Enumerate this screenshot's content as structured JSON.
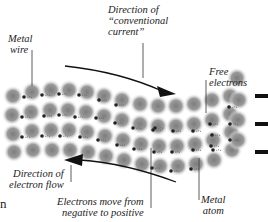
{
  "labels": {
    "metal_wire": [
      "Metal",
      "wire"
    ],
    "conventional_current": [
      "Direction of",
      "“conventional",
      "current”"
    ],
    "free_electrons": [
      "Free",
      "electrons"
    ],
    "electron_flow": [
      "Direction of",
      "electron flow"
    ],
    "electrons_move": [
      "Electrons move from",
      "negative to positive"
    ],
    "metal_atom": [
      "Metal",
      "atom"
    ]
  },
  "edge_fragment": "n",
  "colors": {
    "atom": "#8a8a8a",
    "electron": "#222222",
    "arrow": "#111111",
    "text": "#222222"
  },
  "atoms": [
    [
      13,
      96
    ],
    [
      32,
      92
    ],
    [
      51,
      90
    ],
    [
      69,
      90
    ],
    [
      87,
      92
    ],
    [
      104,
      96
    ],
    [
      122,
      100
    ],
    [
      140,
      104
    ],
    [
      158,
      106
    ],
    [
      176,
      106
    ],
    [
      194,
      104
    ],
    [
      212,
      100
    ],
    [
      230,
      96
    ],
    [
      237,
      78
    ],
    [
      12,
      115
    ],
    [
      31,
      112
    ],
    [
      50,
      110
    ],
    [
      68,
      110
    ],
    [
      86,
      112
    ],
    [
      104,
      116
    ],
    [
      122,
      120
    ],
    [
      140,
      124
    ],
    [
      158,
      126
    ],
    [
      176,
      126
    ],
    [
      194,
      124
    ],
    [
      212,
      120
    ],
    [
      230,
      114
    ],
    [
      239,
      100
    ],
    [
      13,
      134
    ],
    [
      32,
      131
    ],
    [
      51,
      130
    ],
    [
      69,
      130
    ],
    [
      87,
      132
    ],
    [
      105,
      136
    ],
    [
      123,
      140
    ],
    [
      141,
      144
    ],
    [
      159,
      146
    ],
    [
      177,
      146
    ],
    [
      195,
      144
    ],
    [
      213,
      140
    ],
    [
      231,
      132
    ],
    [
      238,
      120
    ],
    [
      14,
      152
    ],
    [
      33,
      150
    ],
    [
      52,
      150
    ],
    [
      70,
      150
    ],
    [
      88,
      152
    ],
    [
      106,
      156
    ],
    [
      124,
      160
    ],
    [
      142,
      164
    ],
    [
      160,
      166
    ],
    [
      178,
      166
    ],
    [
      196,
      164
    ],
    [
      214,
      160
    ],
    [
      232,
      150
    ],
    [
      238,
      140
    ]
  ],
  "electrons": [
    [
      24,
      97
    ],
    [
      42,
      95
    ],
    [
      59,
      94
    ],
    [
      79,
      95
    ],
    [
      99,
      100
    ],
    [
      116,
      105
    ],
    [
      22,
      117
    ],
    [
      44,
      116
    ],
    [
      59,
      115
    ],
    [
      75,
      117
    ],
    [
      96,
      118
    ],
    [
      115,
      123
    ],
    [
      133,
      128
    ],
    [
      153,
      130
    ],
    [
      173,
      131
    ],
    [
      193,
      131
    ],
    [
      210,
      124
    ],
    [
      229,
      107
    ],
    [
      22,
      137
    ],
    [
      42,
      136
    ],
    [
      60,
      136
    ],
    [
      80,
      137
    ],
    [
      98,
      140
    ],
    [
      117,
      145
    ],
    [
      134,
      149
    ],
    [
      154,
      152
    ],
    [
      172,
      152
    ],
    [
      193,
      150
    ],
    [
      211,
      146
    ],
    [
      230,
      124
    ],
    [
      155,
      128
    ],
    [
      212,
      135
    ],
    [
      230,
      140
    ],
    [
      152,
      168
    ],
    [
      171,
      171
    ],
    [
      191,
      169
    ],
    [
      213,
      150
    ]
  ],
  "arrows": {
    "conventional": {
      "path": "M65,66 Q110,74 170,93",
      "head": [
        170,
        93
      ]
    },
    "electron_flow": {
      "path": "M180,183 Q120,165 68,160",
      "head": [
        68,
        160
      ]
    }
  },
  "terminal_dashes": [
    [
      258,
      96
    ],
    [
      258,
      124
    ],
    [
      258,
      152
    ]
  ]
}
